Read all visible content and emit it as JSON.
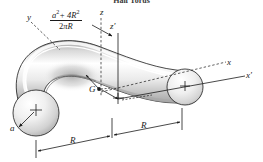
{
  "figure": {
    "title": "Half Torus",
    "type": "engineering-solid-diagram",
    "background_color": "#ffffff",
    "outline_color": "#1a1a1a",
    "surface_light": "#ffffff",
    "surface_mid": "#d8d8d8",
    "surface_dark": "#8f8f8f"
  },
  "centroid_formula": {
    "numerator": "a",
    "numerator_exp": "2",
    "numerator_rest": "+ 4R",
    "numerator_rest_exp": "2",
    "denominator": "2",
    "denominator_pi": "π",
    "denominator_rest": "R",
    "plain": "(a² + 4R²) / (2πR)"
  },
  "axes": [
    {
      "name": "y-axis-label",
      "label": "y",
      "style": "dashed"
    },
    {
      "name": "z-axis-label",
      "label": "z",
      "style": "dashed"
    },
    {
      "name": "z-prime-axis-label",
      "label": "z′",
      "style": "solid"
    },
    {
      "name": "x-axis-label",
      "label": "x",
      "style": "dashed"
    },
    {
      "name": "x-prime-axis-label",
      "label": "x′",
      "style": "solid"
    }
  ],
  "points": [
    {
      "name": "centroid-label",
      "label": "G"
    }
  ],
  "dimensions": [
    {
      "name": "tube-radius",
      "label": "a",
      "style": "leader-arrow"
    },
    {
      "name": "major-radius-left",
      "label": "R",
      "style": "dimension-line"
    },
    {
      "name": "major-radius-right",
      "label": "R",
      "style": "dimension-line"
    }
  ]
}
